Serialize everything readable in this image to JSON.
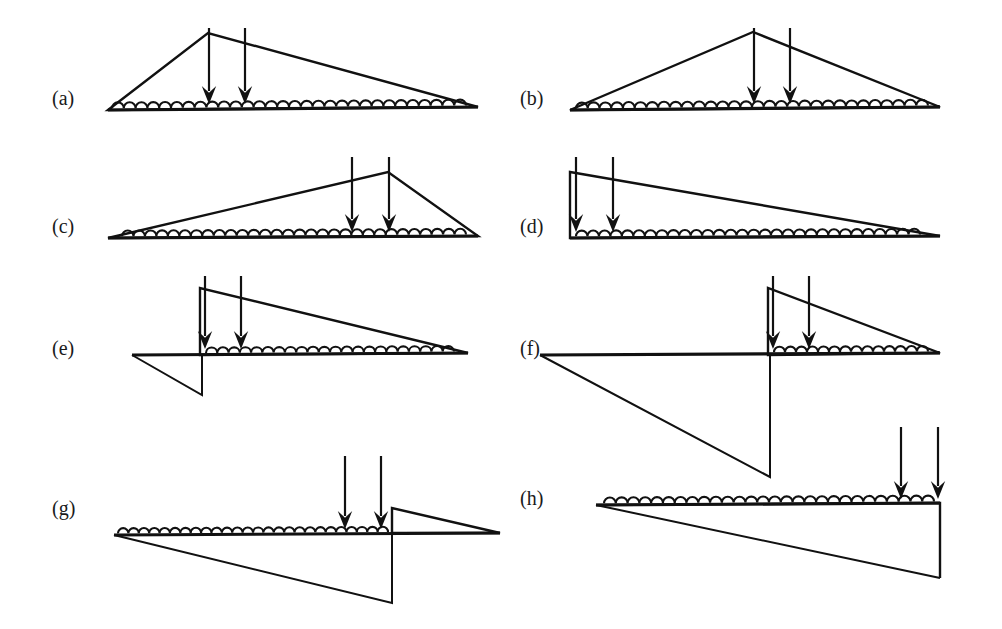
{
  "figure": {
    "title": "",
    "background_color": "#ffffff",
    "ink_color": "#111111",
    "width": 1002,
    "height": 629,
    "panel_count": 8
  },
  "labels": {
    "a": "(a)",
    "b": "(b)",
    "c": "(c)",
    "d": "(d)",
    "e": "(e)",
    "f": "(f)",
    "g": "(g)",
    "h": "(h)"
  },
  "panels": [
    {
      "id": "a",
      "label": "(a)",
      "label_x": 52,
      "label_y": 100,
      "baseline": {
        "x1": 108,
        "y1": 110,
        "x2": 478,
        "y2": 107
      },
      "outline": [
        [
          108,
          110
        ],
        [
          208,
          33
        ],
        [
          478,
          107
        ]
      ],
      "closed": true,
      "foundation": {
        "x1": 112,
        "x2": 466,
        "y": 108,
        "bump_count": 30,
        "side": "top"
      },
      "loads": [
        {
          "x": 209,
          "y_top": 28,
          "y_tip": 104
        },
        {
          "x": 245,
          "y_top": 28,
          "y_tip": 104
        }
      ],
      "extra_paths": []
    },
    {
      "id": "b",
      "label": "(b)",
      "label_x": 520,
      "label_y": 100,
      "baseline": {
        "x1": 570,
        "y1": 110,
        "x2": 940,
        "y2": 107
      },
      "outline": [
        [
          570,
          110
        ],
        [
          753,
          32
        ],
        [
          940,
          107
        ]
      ],
      "closed": true,
      "foundation": {
        "x1": 576,
        "x2": 928,
        "y": 108,
        "bump_count": 30,
        "side": "top"
      },
      "loads": [
        {
          "x": 754,
          "y_top": 28,
          "y_tip": 104
        },
        {
          "x": 790,
          "y_top": 28,
          "y_tip": 104
        }
      ],
      "extra_paths": []
    },
    {
      "id": "c",
      "label": "(c)",
      "label_x": 52,
      "label_y": 228,
      "baseline": {
        "x1": 108,
        "y1": 238,
        "x2": 478,
        "y2": 236
      },
      "outline": [
        [
          108,
          238
        ],
        [
          388,
          172
        ],
        [
          478,
          236
        ]
      ],
      "closed": true,
      "foundation": {
        "x1": 122,
        "x2": 466,
        "y": 237,
        "bump_count": 30,
        "side": "top"
      },
      "loads": [
        {
          "x": 352,
          "y_top": 157,
          "y_tip": 232
        },
        {
          "x": 389,
          "y_top": 157,
          "y_tip": 232
        }
      ],
      "extra_paths": []
    },
    {
      "id": "d",
      "label": "(d)",
      "label_x": 520,
      "label_y": 228,
      "baseline": {
        "x1": 570,
        "y1": 238,
        "x2": 940,
        "y2": 236
      },
      "outline": [
        [
          570,
          238
        ],
        [
          570,
          172
        ],
        [
          940,
          236
        ]
      ],
      "closed": true,
      "foundation": {
        "x1": 576,
        "x2": 920,
        "y": 237,
        "bump_count": 30,
        "side": "top"
      },
      "loads": [
        {
          "x": 576,
          "y_top": 157,
          "y_tip": 232
        },
        {
          "x": 613,
          "y_top": 157,
          "y_tip": 232
        }
      ],
      "extra_paths": []
    },
    {
      "id": "e",
      "label": "(e)",
      "label_x": 52,
      "label_y": 350,
      "baseline": {
        "x1": 132,
        "y1": 355,
        "x2": 468,
        "y2": 353
      },
      "outline": [
        [
          200,
          355
        ],
        [
          200,
          288
        ],
        [
          468,
          353
        ]
      ],
      "closed": true,
      "foundation": {
        "x1": 206,
        "x2": 454,
        "y": 354,
        "bump_count": 22,
        "side": "top"
      },
      "loads": [
        {
          "x": 205,
          "y_top": 276,
          "y_tip": 349
        },
        {
          "x": 241,
          "y_top": 276,
          "y_tip": 349
        }
      ],
      "extra_paths": [
        {
          "name": "lower-cantilever",
          "points": [
            [
              132,
              355
            ],
            [
              202,
              395
            ],
            [
              202,
              355
            ]
          ],
          "closed": false
        }
      ]
    },
    {
      "id": "f",
      "label": "(f)",
      "label_x": 520,
      "label_y": 350,
      "baseline": {
        "x1": 540,
        "y1": 355,
        "x2": 940,
        "y2": 353
      },
      "outline": [
        [
          768,
          355
        ],
        [
          768,
          288
        ],
        [
          940,
          353
        ]
      ],
      "closed": true,
      "foundation": {
        "x1": 774,
        "x2": 928,
        "y": 354,
        "bump_count": 14,
        "side": "top"
      },
      "loads": [
        {
          "x": 773,
          "y_top": 276,
          "y_tip": 349
        },
        {
          "x": 809,
          "y_top": 276,
          "y_tip": 349
        }
      ],
      "extra_paths": [
        {
          "name": "lower-cantilever",
          "points": [
            [
              540,
              355
            ],
            [
              770,
              477
            ],
            [
              770,
              355
            ]
          ],
          "closed": false
        }
      ]
    },
    {
      "id": "g",
      "label": "(g)",
      "label_x": 52,
      "label_y": 510,
      "baseline": {
        "x1": 114,
        "y1": 535,
        "x2": 500,
        "y2": 533
      },
      "outline": [
        [
          392,
          533
        ],
        [
          392,
          508
        ],
        [
          500,
          533
        ]
      ],
      "closed": true,
      "foundation": {
        "x1": 118,
        "x2": 388,
        "y": 534,
        "bump_count": 26,
        "side": "top"
      },
      "loads": [
        {
          "x": 345,
          "y_top": 456,
          "y_tip": 529
        },
        {
          "x": 381,
          "y_top": 456,
          "y_tip": 529
        }
      ],
      "extra_paths": [
        {
          "name": "lower-cantilever",
          "points": [
            [
              114,
              535
            ],
            [
              392,
              603
            ],
            [
              392,
              535
            ]
          ],
          "closed": false
        }
      ]
    },
    {
      "id": "h",
      "label": "(h)",
      "label_x": 520,
      "label_y": 500,
      "baseline": {
        "x1": 596,
        "y1": 505,
        "x2": 940,
        "y2": 503
      },
      "outline": [
        [
          596,
          505
        ],
        [
          940,
          503
        ],
        [
          940,
          578
        ]
      ],
      "closed": false,
      "foundation": {
        "x1": 604,
        "x2": 934,
        "y": 504,
        "bump_count": 28,
        "side": "top"
      },
      "loads": [
        {
          "x": 901,
          "y_top": 427,
          "y_tip": 499
        },
        {
          "x": 938,
          "y_top": 427,
          "y_tip": 499
        }
      ],
      "extra_paths": [
        {
          "name": "lower-cantilever",
          "points": [
            [
              596,
              505
            ],
            [
              940,
              578
            ]
          ],
          "closed": false
        }
      ]
    }
  ],
  "glyphs": {
    "load_arrow": "downward-point-load-arrow",
    "foundation": "elastic-spring-foundation-scallops",
    "beam": "tapered-beam-outline"
  }
}
